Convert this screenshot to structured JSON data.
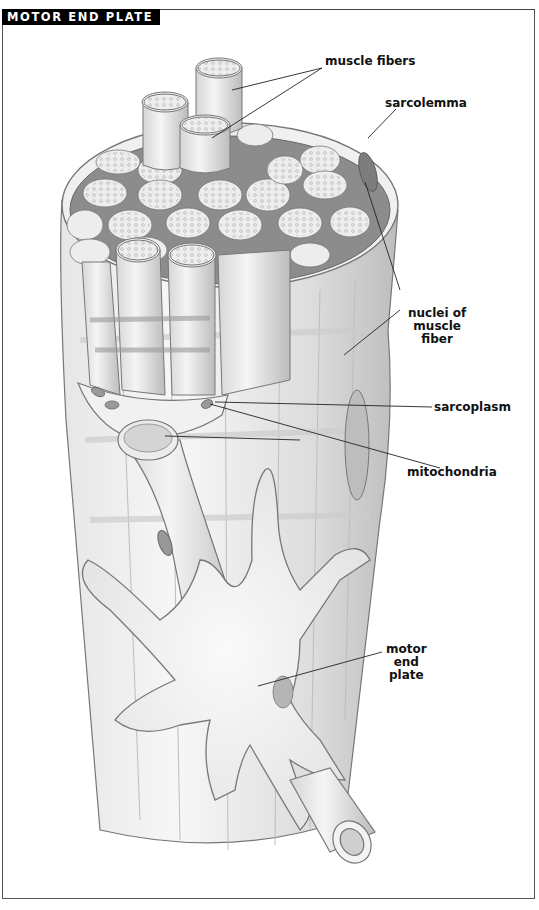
{
  "title": "MOTOR END PLATE",
  "labels": {
    "muscle_fibers": "muscle fibers",
    "sarcolemma": "sarcolemma",
    "nuclei": [
      "nuclei of",
      "muscle",
      "fiber"
    ],
    "sarcoplasm": "sarcoplasm",
    "mitochondria": "mitochondria",
    "motor_end_plate": [
      "motor",
      "end",
      "plate"
    ]
  },
  "colors": {
    "title_bg": "#000000",
    "title_fg": "#ffffff",
    "frame": "#555555",
    "drawing_light": "#f2f2f2",
    "drawing_mid": "#cfcfcf",
    "drawing_dark": "#8a8a8a"
  }
}
